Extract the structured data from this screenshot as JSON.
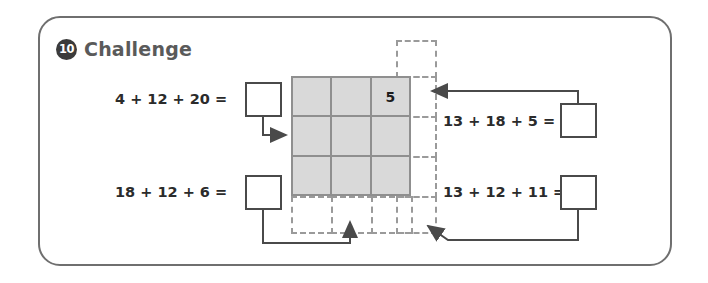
{
  "header": {
    "badge": "10",
    "title": "Challenge"
  },
  "equations": {
    "top_left": {
      "text": "4 + 12 + 20 =",
      "answer": ""
    },
    "bottom_left": {
      "text": "18 + 12 + 6 =",
      "answer": ""
    },
    "top_right": {
      "text": "13 + 18 + 5 =",
      "answer": ""
    },
    "bottom_right": {
      "text": "13 + 12 + 11 =",
      "answer": ""
    }
  },
  "grid": {
    "rows": 3,
    "columns": 3,
    "cells": [
      [
        "",
        "",
        "5"
      ],
      [
        "",
        "",
        ""
      ],
      [
        "",
        "",
        ""
      ]
    ]
  },
  "colors": {
    "frame_border": "#6f6f6f",
    "title_text": "#5a5a5a",
    "badge_fill": "#3b3b3b",
    "grid_fill": "#d9d9d9",
    "grid_line": "#8f8f8f",
    "dashed_line": "#9a9a9a",
    "box_border": "#4a4a4a",
    "wire": "#4a4a4a",
    "equation_text": "#2b2b2b"
  }
}
